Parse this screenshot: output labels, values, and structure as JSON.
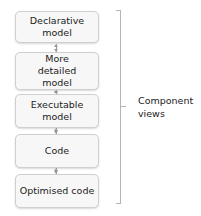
{
  "diagram": {
    "boxes": [
      {
        "label": "Declarative model"
      },
      {
        "label": "More detailed model"
      },
      {
        "label": "Executable model"
      },
      {
        "label": "Code"
      },
      {
        "label": "Optimised code"
      }
    ],
    "connectors": [
      "bidirectional",
      "bidirectional",
      "bidirectional",
      "bidirectional"
    ],
    "bracket": {
      "label_line1": "Component",
      "label_line2": "views"
    },
    "colors": {
      "box_fill": "#f7f7f7",
      "box_border": "#cfcfcf",
      "connector": "#9a9a9a",
      "bracket": "#b5b5b5",
      "text": "#222222"
    }
  }
}
